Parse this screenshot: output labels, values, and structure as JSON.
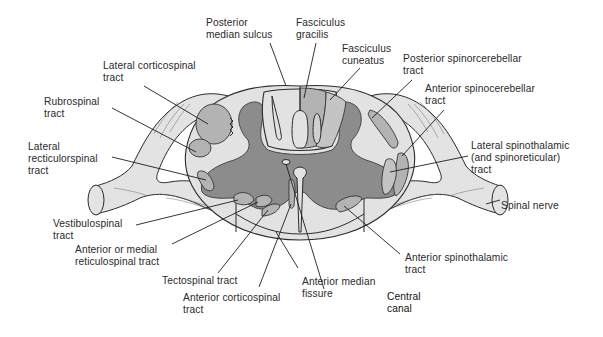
{
  "figure": {
    "colors": {
      "white_matter": "#e2e2e2",
      "gray_matter": "#8c8c8c",
      "tract_fill": "#b3b3b3",
      "outline": "#2b2b2b",
      "label_text": "#2a2a2a"
    }
  },
  "labels": {
    "posterior_median_sulcus": [
      "Posterior",
      "median sulcus"
    ],
    "fasciculus_gracilis": [
      "Fasciculus",
      "gracilis"
    ],
    "fasciculus_cuneatus": [
      "Fasciculus",
      "cuneatus"
    ],
    "lateral_corticospinal": [
      "Lateral corticospinal",
      "tract"
    ],
    "posterior_spinocerebellar": [
      "Posterior spinorcerebellar",
      "tract"
    ],
    "anterior_spinocerebellar": [
      "Anterior spinocerebellar",
      "tract"
    ],
    "rubrospinal": [
      "Rubrospinal",
      "tract"
    ],
    "lateral_reticulospinal": [
      "Lateral",
      "recticulorspinal",
      "tract"
    ],
    "lateral_spinothalamic": [
      "Lateral spinothalamic",
      "(and spinoreticular)",
      "tract"
    ],
    "spinal_nerve": [
      "Spinal nerve"
    ],
    "vestibulospinal": [
      "Vestibulospinal",
      "tract"
    ],
    "anterior_medial_reticulospinal": [
      "Anterior or medial",
      "reticulospinal tract"
    ],
    "anterior_spinothalamic": [
      "Anterior spinothalamic",
      "tract"
    ],
    "tectospinal": [
      "Tectospinal tract"
    ],
    "anterior_corticospinal": [
      "Anterior corticospinal",
      "tract"
    ],
    "anterior_median_fissure": [
      "Anterior median",
      "fissure"
    ],
    "central_canal": [
      "Central",
      "canal"
    ]
  }
}
